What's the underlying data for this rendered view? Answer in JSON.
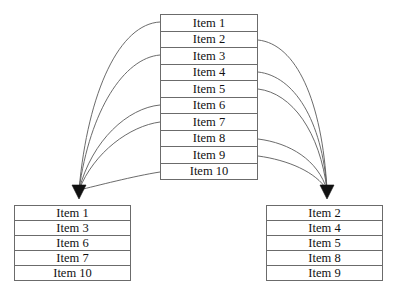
{
  "diagram": {
    "background_color": "#ffffff",
    "line_color": "#5a5a5a",
    "border_color": "#6b6b6b",
    "text_color": "#111111",
    "arrowhead_color": "#111111"
  },
  "source_table": {
    "name": "source-list",
    "rows": [
      "Item 1",
      "Item 2",
      "Item 3",
      "Item 4",
      "Item 5",
      "Item 6",
      "Item 7",
      "Item 8",
      "Item 9",
      "Item 10"
    ]
  },
  "left_table": {
    "name": "left-list",
    "rows": [
      "Item 1",
      "Item 3",
      "Item 6",
      "Item 7",
      "Item 10"
    ]
  },
  "right_table": {
    "name": "right-list",
    "rows": [
      "Item 2",
      "Item 4",
      "Item 5",
      "Item 8",
      "Item 9"
    ]
  },
  "connections": {
    "left_source_rows": [
      1,
      3,
      6,
      7,
      10
    ],
    "right_source_rows": [
      2,
      4,
      5,
      8,
      9
    ],
    "left_arrow_target": {
      "x": 78,
      "y": 198
    },
    "right_arrow_target": {
      "x": 327,
      "y": 198
    }
  }
}
